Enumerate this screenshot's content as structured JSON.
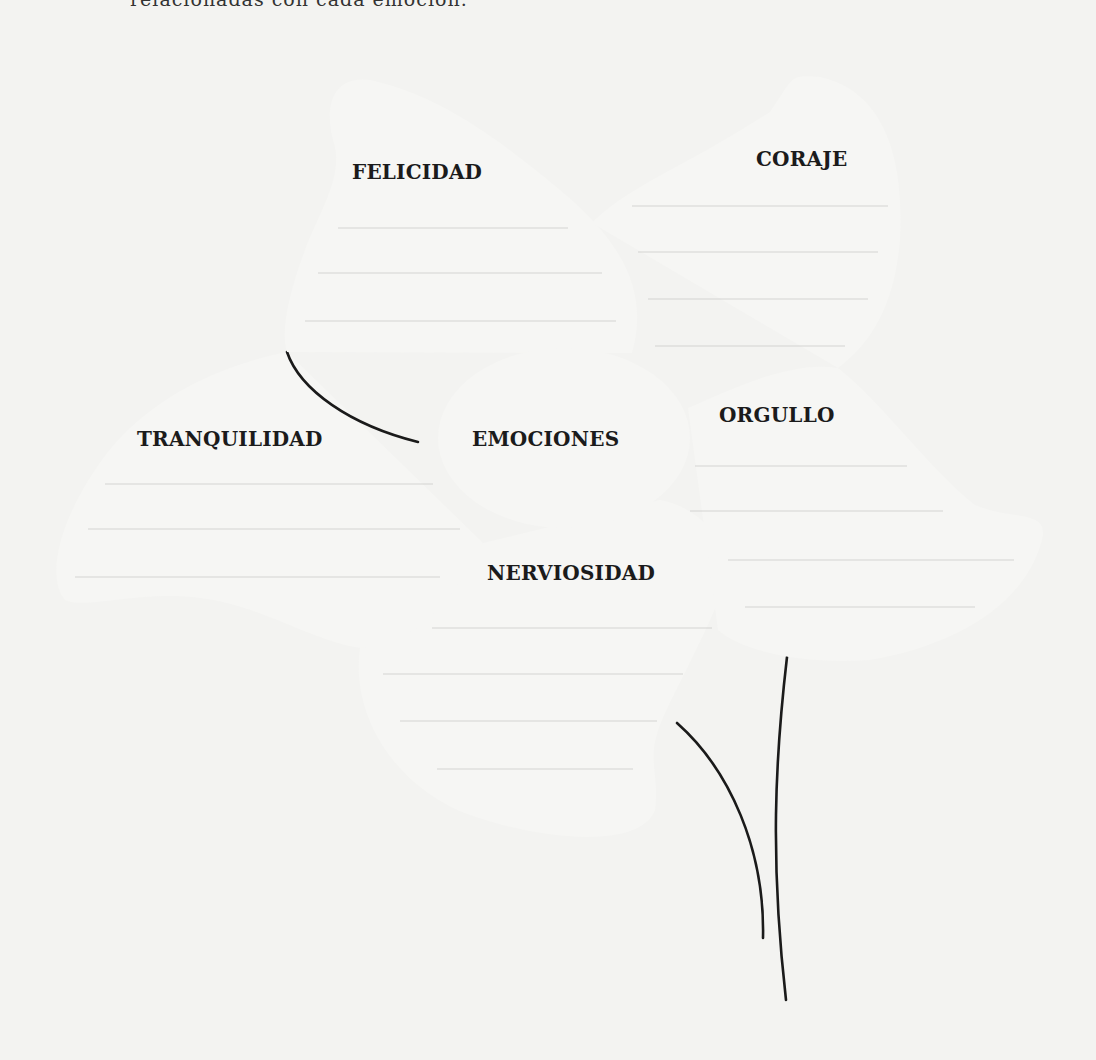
{
  "header": {
    "text": "relacionadas con cada emoción."
  },
  "center": {
    "label": "EMOCIONES"
  },
  "petals": [
    {
      "id": "felicidad",
      "label": "FELICIDAD",
      "lines": 3
    },
    {
      "id": "coraje",
      "label": "CORAJE",
      "lines": 4
    },
    {
      "id": "tranquilidad",
      "label": "TRANQUILIDAD",
      "lines": 3
    },
    {
      "id": "orgullo",
      "label": "ORGULLO",
      "lines": 4
    },
    {
      "id": "nerviosidad",
      "label": "NERVIOSIDAD",
      "lines": 4
    }
  ],
  "colors": {
    "outline": "#1a1a1a",
    "paper": "#f3f3f1",
    "writing_line": "#d4d4d2"
  }
}
